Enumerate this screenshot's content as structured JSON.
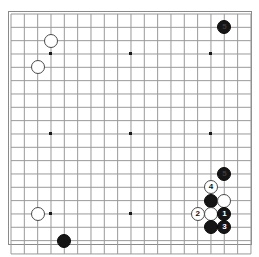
{
  "diagram": {
    "kind": "go-board-diagram",
    "board_size": 19,
    "title": "",
    "background_color": "#ffffff",
    "grid_line_color": "#9a9a9a",
    "border_color": "#8a8a8a",
    "star_point_color": "#1a1a1a",
    "black_stone_color": "#151515",
    "white_stone_color": "#ffffff",
    "white_stone_outline_color": "#4a4a4a",
    "black_label_color": "#ffffff",
    "white_label_color": "#101010"
  },
  "geometry": {
    "origin_x": 11,
    "origin_y": 14,
    "spacing": 13.33,
    "stone_diameter": 14,
    "star_point_indices": [
      3,
      9,
      15
    ]
  },
  "star_points": [
    {
      "col": 3,
      "row": 3
    },
    {
      "col": 9,
      "row": 3
    },
    {
      "col": 15,
      "row": 3
    },
    {
      "col": 3,
      "row": 9
    },
    {
      "col": 9,
      "row": 9
    },
    {
      "col": 15,
      "row": 9
    },
    {
      "col": 3,
      "row": 15
    },
    {
      "col": 9,
      "row": 15
    },
    {
      "col": 15,
      "row": 15
    }
  ],
  "stones": [
    {
      "id": "stone-w-upper-left-a",
      "color": "white",
      "col": 3,
      "row": 2,
      "label": ""
    },
    {
      "id": "stone-w-upper-left-b",
      "color": "white",
      "col": 2,
      "row": 4,
      "label": ""
    },
    {
      "id": "stone-b-upper-right-5",
      "color": "black",
      "col": 16,
      "row": 1,
      "label": "5",
      "faint": true
    },
    {
      "id": "stone-w-lower-left",
      "color": "white",
      "col": 2,
      "row": 15,
      "label": ""
    },
    {
      "id": "stone-b-lower-left",
      "color": "black",
      "col": 4,
      "row": 17,
      "label": ""
    },
    {
      "id": "stone-b-lr-top",
      "color": "black",
      "col": 16,
      "row": 12,
      "label": "5",
      "faint": true
    },
    {
      "id": "stone-w-4",
      "color": "white",
      "col": 15,
      "row": 13,
      "label": "4"
    },
    {
      "id": "stone-b-lr-mid",
      "color": "black",
      "col": 15,
      "row": 14,
      "label": ""
    },
    {
      "id": "stone-w-lr-mid",
      "color": "white",
      "col": 16,
      "row": 14,
      "label": ""
    },
    {
      "id": "stone-w-2",
      "color": "white",
      "col": 14,
      "row": 15,
      "label": "2"
    },
    {
      "id": "stone-w-lr-low",
      "color": "white",
      "col": 15,
      "row": 15,
      "label": ""
    },
    {
      "id": "stone-b-1",
      "color": "black",
      "col": 16,
      "row": 15,
      "label": "1"
    },
    {
      "id": "stone-b-lr-bot",
      "color": "black",
      "col": 15,
      "row": 16,
      "label": ""
    },
    {
      "id": "stone-b-3",
      "color": "black",
      "col": 16,
      "row": 16,
      "label": "3"
    }
  ],
  "move_numbers": [
    "1",
    "2",
    "3",
    "4",
    "5"
  ]
}
